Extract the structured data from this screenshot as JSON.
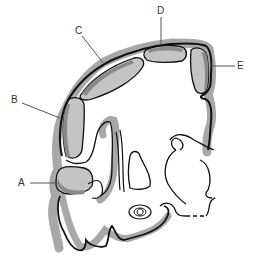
{
  "diagram": {
    "type": "anatomical-cross-section",
    "colors": {
      "outline": "#111111",
      "dark_fill": "#8a8a8a",
      "light_fill": "#c4c4c4",
      "band": "#a8a8a8",
      "leader": "#555555",
      "background": "#ffffff"
    },
    "labels": [
      {
        "id": "A",
        "text": "A",
        "x": 18,
        "y": 178
      },
      {
        "id": "B",
        "text": "B",
        "x": 11,
        "y": 95
      },
      {
        "id": "C",
        "text": "C",
        "x": 75,
        "y": 27
      },
      {
        "id": "D",
        "text": "D",
        "x": 158,
        "y": 7
      },
      {
        "id": "E",
        "text": "E",
        "x": 237,
        "y": 61
      }
    ]
  }
}
